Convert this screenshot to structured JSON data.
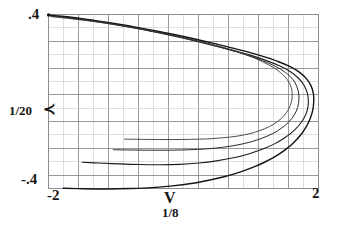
{
  "figure": {
    "background": "#ffffff",
    "ink_color": "#1a1a1a",
    "grid_color": "#8d8d93",
    "grid_minor_color": "#c9c9cf"
  },
  "axes": {
    "y_max_label": ".4",
    "y_min_label": "-.4",
    "y_axis_name": "1/20",
    "y_axis_marker": "≺",
    "x_min_label": "-2",
    "x_max_label": "2",
    "x_axis_name": "V",
    "x_axis_sub": "1/8"
  },
  "chart_data": {
    "type": "line",
    "title": "",
    "xlabel": "V 1/8",
    "ylabel": "1/20",
    "xlim": [
      -2,
      2
    ],
    "ylim": [
      -0.4,
      0.4
    ],
    "grid": true,
    "grid_columns": 18,
    "grid_rows": 13,
    "legend": "none",
    "series": [
      {
        "name": "outer-curve",
        "color": "#141414",
        "width": 1.4,
        "points": [
          [
            -2.0,
            0.398
          ],
          [
            -1.8,
            0.392
          ],
          [
            -1.55,
            0.383
          ],
          [
            -1.3,
            0.372
          ],
          [
            -1.05,
            0.36
          ],
          [
            -0.8,
            0.347
          ],
          [
            -0.55,
            0.333
          ],
          [
            -0.3,
            0.318
          ],
          [
            -0.05,
            0.302
          ],
          [
            0.2,
            0.285
          ],
          [
            0.45,
            0.267
          ],
          [
            0.7,
            0.248
          ],
          [
            0.95,
            0.228
          ],
          [
            1.2,
            0.205
          ],
          [
            1.4,
            0.184
          ],
          [
            1.58,
            0.16
          ],
          [
            1.72,
            0.134
          ],
          [
            1.82,
            0.105
          ],
          [
            1.89,
            0.072
          ],
          [
            1.925,
            0.035
          ],
          [
            1.93,
            0.0
          ],
          [
            1.915,
            -0.04
          ],
          [
            1.875,
            -0.08
          ],
          [
            1.815,
            -0.118
          ],
          [
            1.735,
            -0.154
          ],
          [
            1.635,
            -0.188
          ],
          [
            1.515,
            -0.22
          ],
          [
            1.375,
            -0.25
          ],
          [
            1.215,
            -0.277
          ],
          [
            1.035,
            -0.302
          ],
          [
            0.835,
            -0.325
          ],
          [
            0.615,
            -0.345
          ],
          [
            0.375,
            -0.362
          ],
          [
            0.115,
            -0.377
          ],
          [
            -0.165,
            -0.388
          ],
          [
            -0.465,
            -0.396
          ],
          [
            -0.785,
            -0.4
          ],
          [
            -1.125,
            -0.402
          ],
          [
            -1.485,
            -0.401
          ],
          [
            -1.78,
            -0.399
          ]
        ]
      },
      {
        "name": "second-curve",
        "color": "#1c1c1c",
        "width": 1.1,
        "points": [
          [
            -2.0,
            0.397
          ],
          [
            -1.75,
            0.389
          ],
          [
            -1.5,
            0.379
          ],
          [
            -1.25,
            0.368
          ],
          [
            -1.0,
            0.355
          ],
          [
            -0.75,
            0.341
          ],
          [
            -0.5,
            0.326
          ],
          [
            -0.25,
            0.31
          ],
          [
            0.0,
            0.293
          ],
          [
            0.25,
            0.275
          ],
          [
            0.5,
            0.255
          ],
          [
            0.75,
            0.234
          ],
          [
            1.0,
            0.212
          ],
          [
            1.22,
            0.189
          ],
          [
            1.42,
            0.164
          ],
          [
            1.58,
            0.138
          ],
          [
            1.7,
            0.108
          ],
          [
            1.785,
            0.075
          ],
          [
            1.835,
            0.038
          ],
          [
            1.85,
            0.0
          ],
          [
            1.835,
            -0.038
          ],
          [
            1.79,
            -0.074
          ],
          [
            1.715,
            -0.108
          ],
          [
            1.615,
            -0.14
          ],
          [
            1.49,
            -0.169
          ],
          [
            1.34,
            -0.196
          ],
          [
            1.165,
            -0.22
          ],
          [
            0.965,
            -0.241
          ],
          [
            0.74,
            -0.259
          ],
          [
            0.49,
            -0.273
          ],
          [
            0.225,
            -0.283
          ],
          [
            -0.055,
            -0.289
          ],
          [
            -0.345,
            -0.291
          ],
          [
            -0.645,
            -0.29
          ],
          [
            -0.955,
            -0.287
          ],
          [
            -1.265,
            -0.283
          ],
          [
            -1.5,
            -0.279
          ]
        ]
      },
      {
        "name": "inner-curve-upper",
        "color": "#2a2a2a",
        "width": 1.0,
        "points": [
          [
            -1.98,
            0.393
          ],
          [
            -1.7,
            0.384
          ],
          [
            -1.42,
            0.373
          ],
          [
            -1.14,
            0.36
          ],
          [
            -0.86,
            0.345
          ],
          [
            -0.58,
            0.329
          ],
          [
            -0.3,
            0.311
          ],
          [
            -0.02,
            0.292
          ],
          [
            0.26,
            0.271
          ],
          [
            0.54,
            0.249
          ],
          [
            0.82,
            0.225
          ],
          [
            1.06,
            0.201
          ],
          [
            1.27,
            0.175
          ],
          [
            1.44,
            0.148
          ],
          [
            1.57,
            0.118
          ],
          [
            1.655,
            0.085
          ],
          [
            1.7,
            0.048
          ],
          [
            1.71,
            0.01
          ],
          [
            1.69,
            -0.028
          ],
          [
            1.64,
            -0.062
          ],
          [
            1.56,
            -0.094
          ],
          [
            1.455,
            -0.122
          ],
          [
            1.325,
            -0.147
          ],
          [
            1.17,
            -0.168
          ],
          [
            0.995,
            -0.186
          ],
          [
            0.795,
            -0.2
          ],
          [
            0.575,
            -0.211
          ],
          [
            0.335,
            -0.218
          ],
          [
            0.075,
            -0.222
          ],
          [
            -0.195,
            -0.224
          ],
          [
            -0.475,
            -0.224
          ],
          [
            -0.755,
            -0.223
          ],
          [
            -1.04,
            -0.222
          ]
        ]
      },
      {
        "name": "innermost-curve",
        "color": "#3a3a3a",
        "width": 0.9,
        "points": [
          [
            -1.96,
            0.39
          ],
          [
            -1.65,
            0.38
          ],
          [
            -1.34,
            0.368
          ],
          [
            -1.03,
            0.354
          ],
          [
            -0.72,
            0.338
          ],
          [
            -0.41,
            0.32
          ],
          [
            -0.1,
            0.3
          ],
          [
            0.21,
            0.278
          ],
          [
            0.52,
            0.254
          ],
          [
            0.8,
            0.228
          ],
          [
            1.04,
            0.201
          ],
          [
            1.24,
            0.172
          ],
          [
            1.4,
            0.142
          ],
          [
            1.515,
            0.109
          ],
          [
            1.585,
            0.074
          ],
          [
            1.61,
            0.037
          ],
          [
            1.6,
            0.0
          ],
          [
            1.56,
            -0.034
          ],
          [
            1.49,
            -0.065
          ],
          [
            1.395,
            -0.092
          ],
          [
            1.275,
            -0.115
          ],
          [
            1.13,
            -0.134
          ],
          [
            0.965,
            -0.149
          ],
          [
            0.78,
            -0.16
          ],
          [
            0.575,
            -0.167
          ],
          [
            0.355,
            -0.172
          ],
          [
            0.12,
            -0.174
          ],
          [
            -0.125,
            -0.175
          ],
          [
            -0.375,
            -0.175
          ],
          [
            -0.625,
            -0.174
          ],
          [
            -0.875,
            -0.173
          ]
        ]
      }
    ]
  }
}
